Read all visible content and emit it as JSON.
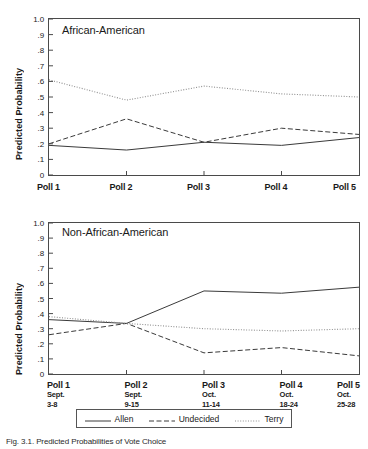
{
  "figure": {
    "caption": "Fig. 3.1.  Predicted Probabilities of Vote Choice",
    "ylabel": "Predicted Probability",
    "y_ticks": [
      "1.0",
      ".9",
      ".8",
      ".7",
      ".6",
      ".5",
      ".4",
      ".3",
      ".2",
      ".1",
      "0"
    ],
    "legend": [
      {
        "label": "Allen",
        "style": "solid",
        "color": "#3d3d3d"
      },
      {
        "label": "Undecided",
        "style": "dashed",
        "color": "#3d3d3d"
      },
      {
        "label": "Terry",
        "style": "dotted",
        "color": "#8a8a8a"
      }
    ]
  },
  "chart_data": [
    {
      "type": "line",
      "title": "African-American",
      "xlabel": "",
      "ylabel": "Predicted Probability",
      "ylim": [
        0,
        1.0
      ],
      "yticks": [
        0,
        0.1,
        0.2,
        0.3,
        0.4,
        0.5,
        0.6,
        0.7,
        0.8,
        0.9,
        1.0
      ],
      "grid": false,
      "legend_position": "bottom",
      "categories": [
        "Poll 1",
        "Poll 2",
        "Poll 3",
        "Poll 4",
        "Poll 5"
      ],
      "series": [
        {
          "name": "Allen",
          "style": "solid",
          "values": [
            0.19,
            0.16,
            0.21,
            0.19,
            0.24
          ]
        },
        {
          "name": "Undecided",
          "style": "dashed",
          "values": [
            0.2,
            0.36,
            0.21,
            0.3,
            0.26
          ]
        },
        {
          "name": "Terry",
          "style": "dotted",
          "values": [
            0.61,
            0.48,
            0.57,
            0.52,
            0.5
          ]
        }
      ]
    },
    {
      "type": "line",
      "title": "Non-African-American",
      "xlabel": "",
      "ylabel": "Predicted Probability",
      "ylim": [
        0,
        1.0
      ],
      "yticks": [
        0,
        0.1,
        0.2,
        0.3,
        0.4,
        0.5,
        0.6,
        0.7,
        0.8,
        0.9,
        1.0
      ],
      "grid": false,
      "legend_position": "bottom",
      "categories": [
        "Poll 1",
        "Poll 2",
        "Poll 3",
        "Poll 4",
        "Poll 5"
      ],
      "category_dates": [
        "Sept.|3-8",
        "Sept.|9-15",
        "Oct.|11-14",
        "Oct.|18-24",
        "Oct.|25-28"
      ],
      "series": [
        {
          "name": "Allen",
          "style": "solid",
          "values": [
            0.36,
            0.335,
            0.55,
            0.535,
            0.575
          ]
        },
        {
          "name": "Undecided",
          "style": "dashed",
          "values": [
            0.26,
            0.335,
            0.14,
            0.175,
            0.12
          ]
        },
        {
          "name": "Terry",
          "style": "dotted",
          "values": [
            0.38,
            0.335,
            0.3,
            0.285,
            0.3
          ]
        }
      ]
    }
  ],
  "top": {
    "title": "African-American",
    "xticks": [
      "Poll 1",
      "Poll 2",
      "Poll 3",
      "Poll 4",
      "Poll 5"
    ]
  },
  "bottom": {
    "title": "Non-African-American",
    "xticks": [
      {
        "poll": "Poll 1",
        "month": "Sept.",
        "days": "3-8"
      },
      {
        "poll": "Poll 2",
        "month": "Sept.",
        "days": "9-15"
      },
      {
        "poll": "Poll 3",
        "month": "Oct.",
        "days": "11-14"
      },
      {
        "poll": "Poll 4",
        "month": "Oct.",
        "days": "18-24"
      },
      {
        "poll": "Poll 5",
        "month": "Oct.",
        "days": "25-28"
      }
    ]
  }
}
